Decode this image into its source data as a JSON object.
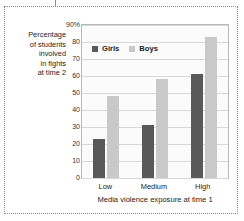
{
  "chart_data": {
    "type": "bar",
    "title": "",
    "categories": [
      "Low",
      "Medium",
      "High"
    ],
    "series": [
      {
        "name": "Girls",
        "color": "#595959",
        "values": [
          23,
          31,
          61
        ]
      },
      {
        "name": "Boys",
        "color": "#c9c9c9",
        "values": [
          48,
          58,
          83
        ]
      }
    ],
    "xlabel": "Media violence exposure at time 1",
    "ylabel": "Percentage of students involved in fights at time 2",
    "ylim": [
      0,
      90
    ],
    "ytick_labels": [
      "90%",
      "80",
      "70",
      "60",
      "50",
      "40",
      "30",
      "20",
      "10",
      "0"
    ],
    "ytick_values": [
      90,
      80,
      70,
      60,
      50,
      40,
      30,
      20,
      10,
      0
    ],
    "grid": true,
    "legend_position": "top-left-inside"
  },
  "axis": {
    "y_caption_lines": [
      "Percentage",
      "of students",
      "involved",
      "in fights",
      "at time 2"
    ],
    "x_title": "Media violence exposure at time 1"
  },
  "legend": {
    "items": [
      {
        "label": "Girls"
      },
      {
        "label": "Boys"
      }
    ]
  }
}
